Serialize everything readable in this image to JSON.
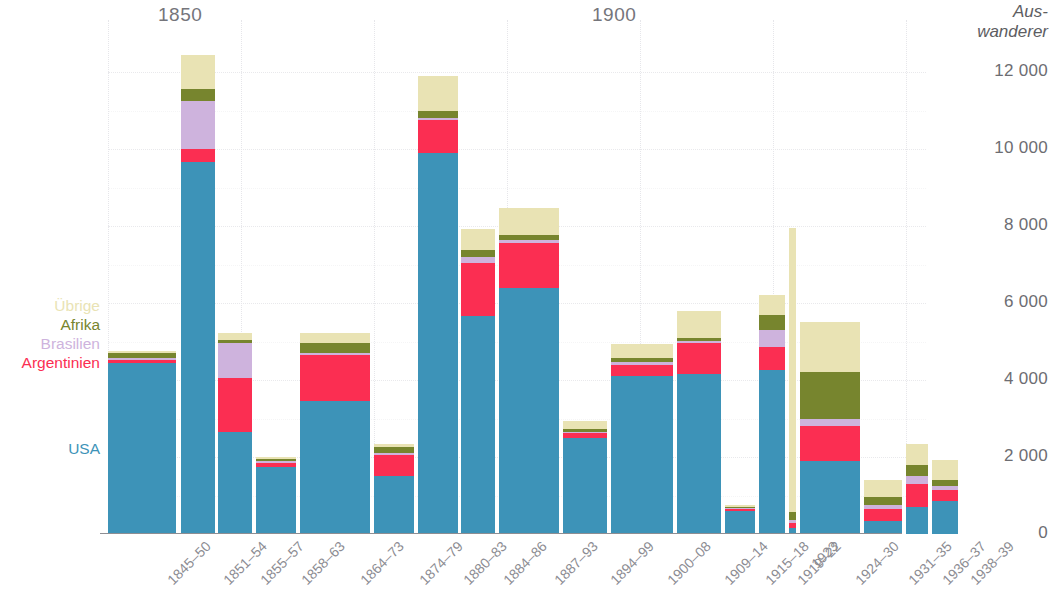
{
  "y_axis": {
    "title_line1": "Aus-",
    "title_line2": "wanderer",
    "ticks": [
      "12 000",
      "10 000",
      "8 000",
      "6 000",
      "4 000",
      "2 000",
      "0"
    ]
  },
  "era_labels": [
    {
      "text": "1850",
      "x": 158
    },
    {
      "text": "1900",
      "x": 592
    }
  ],
  "legend": {
    "items": [
      {
        "label": "Übrige",
        "color": "#e9e3b4"
      },
      {
        "label": "Afrika",
        "color": "#77852e"
      },
      {
        "label": "Brasilien",
        "color": "#ceb3dd"
      },
      {
        "label": "Argentinien",
        "color": "#fb2e52"
      }
    ],
    "usa": {
      "label": "USA",
      "color": "#3d93b8"
    }
  },
  "chart_data": {
    "type": "bar",
    "subtype": "stacked",
    "title": "",
    "xlabel": "",
    "ylabel": "Auswanderer",
    "ylim": [
      0,
      12000
    ],
    "ytick_values": [
      0,
      2000,
      4000,
      6000,
      8000,
      10000,
      12000
    ],
    "grid": true,
    "legend_position": "left",
    "series_order": [
      "USA",
      "Argentinien",
      "Brasilien",
      "Afrika",
      "Übrige"
    ],
    "colors": {
      "USA": "#3d93b8",
      "Argentinien": "#fb2e52",
      "Brasilien": "#ceb3dd",
      "Afrika": "#77852e",
      "Übrige": "#e9e3b4"
    },
    "categories": [
      "1845–50",
      "1851–54",
      "1855–57",
      "1858–63",
      "1864–73",
      "1874–79",
      "1880–83",
      "1884–86",
      "1887–93",
      "1894–99",
      "1900–08",
      "1909–14",
      "1915–18",
      "1919–22",
      "1923",
      "1924–30",
      "1931–35",
      "1936–37",
      "1938–39"
    ],
    "series": [
      {
        "name": "USA",
        "values": [
          4450,
          9650,
          2650,
          1750,
          3450,
          1500,
          9900,
          5650,
          6400,
          2500,
          4100,
          4150,
          600,
          4250,
          150,
          1900,
          350,
          700,
          850
        ]
      },
      {
        "name": "Argentinien",
        "values": [
          80,
          350,
          1400,
          100,
          1200,
          550,
          850,
          1400,
          1150,
          130,
          300,
          800,
          60,
          600,
          130,
          900,
          300,
          600,
          300
        ]
      },
      {
        "name": "Brasilien",
        "values": [
          50,
          1250,
          900,
          50,
          50,
          50,
          50,
          150,
          100,
          30,
          60,
          60,
          20,
          450,
          80,
          200,
          100,
          200,
          100
        ]
      },
      {
        "name": "Afrika",
        "values": [
          120,
          300,
          100,
          40,
          250,
          170,
          200,
          180,
          120,
          80,
          120,
          80,
          20,
          400,
          200,
          1200,
          200,
          300,
          150
        ]
      },
      {
        "name": "Übrige",
        "values": [
          50,
          900,
          180,
          70,
          280,
          80,
          900,
          550,
          700,
          200,
          350,
          700,
          50,
          500,
          7400,
          1300,
          450,
          550,
          520
        ]
      }
    ],
    "bar_pixel_layout": [
      {
        "left": 0,
        "width": 68
      },
      {
        "left": 73,
        "width": 34
      },
      {
        "left": 110,
        "width": 34
      },
      {
        "left": 148,
        "width": 40
      },
      {
        "left": 192,
        "width": 70
      },
      {
        "left": 266,
        "width": 40
      },
      {
        "left": 310,
        "width": 40
      },
      {
        "left": 353,
        "width": 34
      },
      {
        "left": 391,
        "width": 60
      },
      {
        "left": 455,
        "width": 44
      },
      {
        "left": 503,
        "width": 62
      },
      {
        "left": 569,
        "width": 44
      },
      {
        "left": 617,
        "width": 30
      },
      {
        "left": 651,
        "width": 26
      },
      {
        "left": 681,
        "width": 7
      },
      {
        "left": 692,
        "width": 60
      },
      {
        "left": 756,
        "width": 38
      },
      {
        "left": 798,
        "width": 22
      },
      {
        "left": 824,
        "width": 26
      }
    ]
  }
}
